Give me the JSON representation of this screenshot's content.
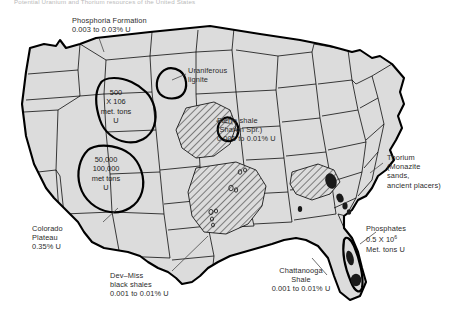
{
  "figure": {
    "caption_top": "Potential Uranium and Thorium resources of the United States",
    "background": "#ffffff",
    "land_fill": "#dcdcdc",
    "outline_color": "#000000",
    "hatch_color": "#000000",
    "dark_blob_color": "#1a1a1a"
  },
  "annotations": {
    "phosphoria": {
      "line1": "Phosphoria Formation",
      "line2": "0.003 to 0.03% U"
    },
    "uraniferous_lignite": {
      "line1": "Uraniferous",
      "line2": "lignite"
    },
    "pierre_shale": {
      "line1": "Pierre shale",
      "line2": "(Sharon Spr.)",
      "line3": "0.001 to 0.01% U"
    },
    "thorium": {
      "line1": "Thorium",
      "line2": "(Monazite",
      "line3": "sands,",
      "line4": "ancient placers)"
    },
    "phosphates": {
      "line1": "Phosphates",
      "line2_pre": "0.5 X 10",
      "line2_sup": "6",
      "line3": "Met. tons U"
    },
    "chattanooga": {
      "line1": "Chattanooga",
      "line2": "Shale",
      "line3": "0.001 to 0.01% U"
    },
    "dev_miss": {
      "line1": "Dev–Miss",
      "line2": "black shales",
      "line3": "0.001 to 0.01% U"
    },
    "colorado_plateau": {
      "line1": "Colorado",
      "line2": "Plateau",
      "line3": "0.35% U"
    },
    "wyoming_reserve": {
      "line1": "500",
      "line2_pre": "X 10",
      "line2_sup": "6",
      "line3": "met. tons",
      "line4": "U"
    },
    "plateau_reserve": {
      "line1": "50,000",
      "line2": "100,000",
      "line3": "met tons",
      "line4": "U"
    }
  }
}
